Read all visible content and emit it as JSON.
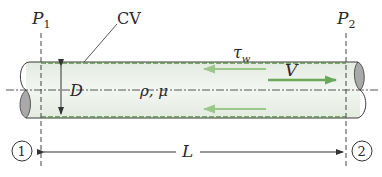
{
  "diagram": {
    "labels": {
      "p1": "P",
      "p1_sub": "1",
      "p2": "P",
      "p2_sub": "2",
      "cv": "CV",
      "tau": "τ",
      "tau_sub": "w",
      "velocity": "V",
      "diameter": "D",
      "properties": "ρ, μ",
      "length": "L",
      "section1": "1",
      "section2": "2"
    },
    "colors": {
      "cv_boundary": "#5e8f4e",
      "shear_arrow": "#8fbf7a",
      "velocity_arrow": "#6aa85a",
      "pipe_fill": "#eef3ec",
      "pipe_stroke": "#3a3a3a",
      "end_cap_fill": "#a9a9a9"
    }
  }
}
